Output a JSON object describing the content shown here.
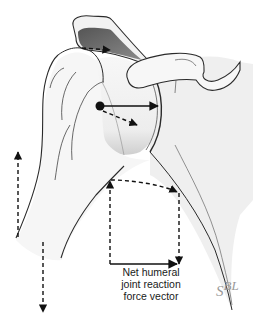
{
  "figure": {
    "structures": [
      "acromion",
      "coracoid process",
      "humeral head",
      "humerus shaft",
      "glenoid / scapula"
    ],
    "vectors": [
      {
        "name": "net-joint-reaction-force",
        "style": "solid",
        "direction": "right (compressive into glenoid)"
      },
      {
        "name": "component-inferior-medial",
        "style": "dashed",
        "direction": "down-right"
      },
      {
        "name": "acromion-shear",
        "style": "dashed",
        "direction": "right"
      },
      {
        "name": "arm-upward",
        "style": "dashed",
        "direction": "up"
      },
      {
        "name": "arm-downward",
        "style": "dashed",
        "direction": "down"
      },
      {
        "name": "resolution-parallelogram",
        "style": "dashed",
        "direction": "composite"
      }
    ]
  },
  "labels": {
    "caption_lines": [
      "Net humeral",
      "joint reaction",
      "force vector"
    ],
    "signature_base": "S",
    "signature_sup": "BL"
  },
  "colors": {
    "outline": "#2a2a2a",
    "bone_fill": "#f4f4f4",
    "shadow_fill": "#d6d6d6",
    "acromion_dark": "#6a6a6a",
    "arrow": "#111111",
    "signature": "#9a9a9a"
  }
}
